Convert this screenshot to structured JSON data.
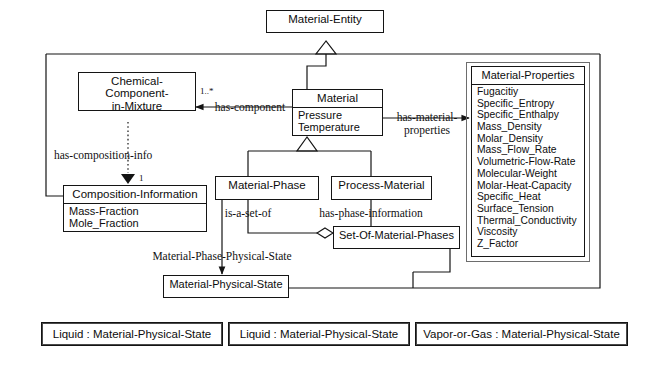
{
  "diagram": {
    "stroke": "#141414",
    "frame_stroke": "#6d6d6d"
  },
  "classes": {
    "material_entity": {
      "name": "Material-Entity"
    },
    "chemical_component": {
      "name": "Chemical-Component-\nin-Mixture"
    },
    "material": {
      "name": "Material",
      "attributes": [
        "Pressure",
        "Temperature"
      ]
    },
    "material_properties": {
      "name": "Material-Properties",
      "attributes": [
        "Fugacitiy",
        "Specific_Entropy",
        "Specific_Enthalpy",
        "Mass_Density",
        "Molar_Density",
        "Mass_Flow_Rate",
        "Volumetric-Flow-Rate",
        "Molecular-Weight",
        "Molar-Heat-Capacity",
        "Specific_Heat",
        "Surface_Tension",
        "Thermal_Conductivity",
        "Viscosity",
        "Z_Factor"
      ]
    },
    "composition_information": {
      "name": "Composition-Information",
      "attributes": [
        "Mass-Fraction",
        "Mole_Fraction"
      ]
    },
    "material_phase": {
      "name": "Material-Phase"
    },
    "process_material": {
      "name": "Process-Material"
    },
    "set_of_material_phases": {
      "name": "Set-Of-Material-Phases"
    },
    "material_physical_state": {
      "name": "Material-Physical-State"
    }
  },
  "instances": [
    {
      "label": "Liquid : Material-Physical-State"
    },
    {
      "label": "Liquid : Material-Physical-State"
    },
    {
      "label": "Vapor-or-Gas : Material-Physical-State"
    }
  ],
  "edge_labels": {
    "has_component": "has-component",
    "has_material_properties": "has-material-\nproperties",
    "has_composition_info": "has-composition-info",
    "is_a_set_of": "is-a-set-of",
    "has_phase_information": "has-phase-information",
    "material_phase_physical_state": "Material-Phase-Physical-State"
  },
  "multiplicities": {
    "has_component": "1..*",
    "composition_one": "1"
  }
}
